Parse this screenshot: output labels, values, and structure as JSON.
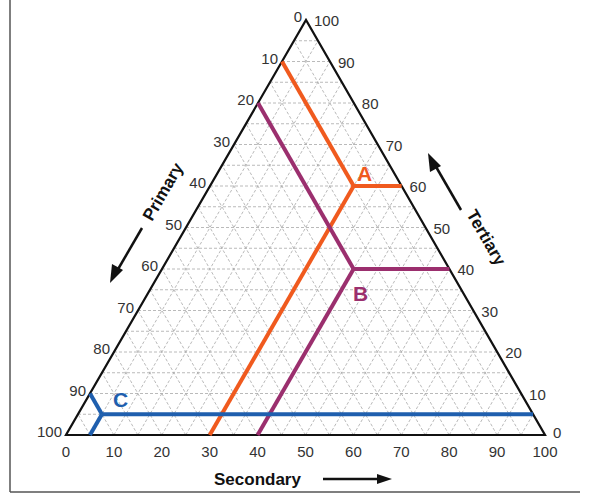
{
  "chart_data": {
    "type": "ternary",
    "title": "",
    "axes": {
      "primary": {
        "label": "Primary",
        "direction": "increases toward bottom-left vertex",
        "ticks": [
          "0",
          "10",
          "20",
          "30",
          "40",
          "50",
          "60",
          "70",
          "80",
          "90",
          "100"
        ]
      },
      "secondary": {
        "label": "Secondary",
        "direction": "increases toward bottom-right vertex",
        "ticks": [
          "0",
          "10",
          "20",
          "30",
          "40",
          "50",
          "60",
          "70",
          "80",
          "90",
          "100"
        ]
      },
      "tertiary": {
        "label": "Tertiary",
        "direction": "increases toward top vertex",
        "ticks": [
          "0",
          "10",
          "20",
          "30",
          "40",
          "50",
          "60",
          "70",
          "80",
          "90",
          "100"
        ]
      }
    },
    "grid": {
      "on": true,
      "interval": 5,
      "style": "dashed gray"
    },
    "points": [
      {
        "label": "A",
        "primary": 10,
        "secondary": 30,
        "tertiary": 60,
        "color": "#f05a1e"
      },
      {
        "label": "B",
        "primary": 20,
        "secondary": 40,
        "tertiary": 40,
        "color": "#9b2f6e"
      },
      {
        "label": "C",
        "primary": 90,
        "secondary": 5,
        "tertiary": 5,
        "color": "#1f5fae"
      }
    ]
  },
  "labels": {
    "primary": "Primary",
    "secondary": "Secondary",
    "tertiary": "Tertiary",
    "point_a": "A",
    "point_b": "B",
    "point_c": "C"
  },
  "colors": {
    "a": "#f05a1e",
    "b": "#9b2f6e",
    "c": "#1f5fae",
    "grid": "#a8a8a8",
    "axis": "#111111"
  }
}
